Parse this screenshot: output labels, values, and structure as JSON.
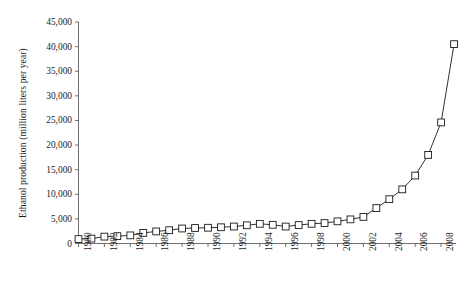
{
  "chart_data": {
    "type": "line",
    "title": "",
    "xlabel": "",
    "ylabel": "Ethanol production (million liters per year)",
    "ylim": [
      0,
      45000
    ],
    "xlim": [
      1980,
      2009
    ],
    "grid": false,
    "legend": "none",
    "marker": "open-square",
    "line_color": "#1a1a1a",
    "marker_fill": "#ffffff",
    "marker_edge": "#1a1a1a",
    "y_ticks": [
      0,
      5000,
      10000,
      15000,
      20000,
      25000,
      30000,
      35000,
      40000,
      45000
    ],
    "y_tick_labels": [
      "0",
      "5,000",
      "10,000",
      "15,000",
      "20,000",
      "25,000",
      "30,000",
      "35,000",
      "40,000",
      "45,000"
    ],
    "x_ticks": [
      1980,
      1982,
      1984,
      1986,
      1988,
      1990,
      1992,
      1994,
      1996,
      1998,
      2000,
      2002,
      2004,
      2006,
      2008
    ],
    "x_tick_labels": [
      "1980",
      "1982",
      "1984",
      "1986",
      "1988",
      "1990",
      "1992",
      "1994",
      "1996",
      "1998",
      "2000",
      "2002",
      "2004",
      "2006",
      "2008"
    ],
    "x": [
      1980,
      1981,
      1982,
      1983,
      1984,
      1985,
      1986,
      1987,
      1988,
      1989,
      1990,
      1991,
      1992,
      1993,
      1994,
      1995,
      1996,
      1997,
      1998,
      1999,
      2000,
      2001,
      2002,
      2003,
      2004,
      2005,
      2006,
      2007,
      2008,
      2009
    ],
    "values": [
      900,
      1000,
      1400,
      1500,
      1650,
      2150,
      2450,
      2700,
      3050,
      3150,
      3200,
      3300,
      3450,
      3700,
      4000,
      3800,
      3450,
      3750,
      4000,
      4150,
      4500,
      4900,
      5400,
      7200,
      9000,
      11000,
      13800,
      18000,
      24600,
      34000
    ],
    "last_value": 40500
  }
}
